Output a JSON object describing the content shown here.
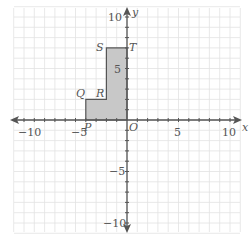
{
  "chart_data": {
    "type": "coordinate-grid",
    "title": "",
    "xlabel": "x",
    "ylabel": "y",
    "xlim": [
      -10,
      10
    ],
    "ylim": [
      -10,
      10
    ],
    "grid": true,
    "x_ticks": [
      -10,
      -5,
      5,
      10
    ],
    "y_ticks": [
      10,
      5,
      -5,
      -10
    ],
    "origin_label": "O",
    "polygon": {
      "fill": "#c8c8c8",
      "stroke": "#555555",
      "vertices": [
        {
          "name": "P",
          "x": -4,
          "y": 0
        },
        {
          "name": "Q",
          "x": -4,
          "y": 2
        },
        {
          "name": "R",
          "x": -2,
          "y": 2
        },
        {
          "name": "S",
          "x": -2,
          "y": 7
        },
        {
          "name": "T",
          "x": 0,
          "y": 7
        },
        {
          "name": "O",
          "x": 0,
          "y": 0
        }
      ]
    }
  },
  "labels": {
    "x_axis": "x",
    "y_axis": "y",
    "origin": "O",
    "x_tick_neg10": "−10",
    "x_tick_neg5": "−5",
    "x_tick_5": "5",
    "x_tick_10": "10",
    "y_tick_10": "10",
    "y_tick_5": "5",
    "y_tick_neg5": "−5",
    "y_tick_neg10": "−10",
    "P": "P",
    "Q": "Q",
    "R": "R",
    "S": "S",
    "T": "T"
  },
  "colors": {
    "grid": "#e2e2e2",
    "axis": "#555555",
    "shape_fill": "#c8c8c8"
  }
}
